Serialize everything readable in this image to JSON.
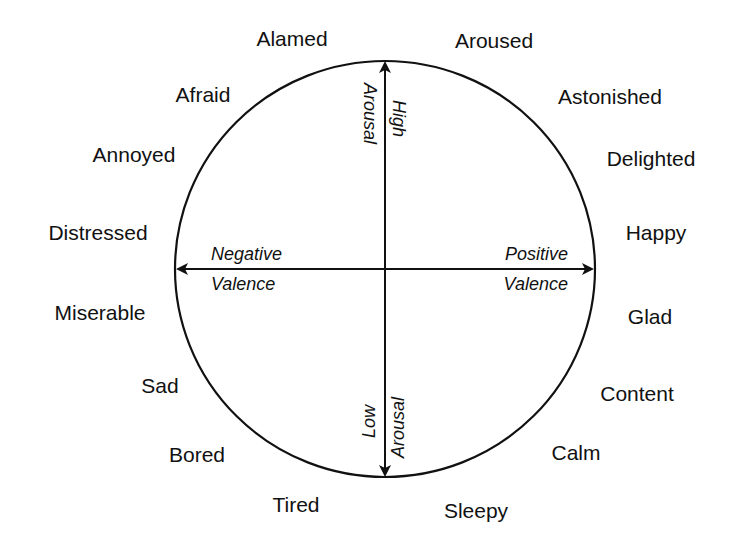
{
  "diagram": {
    "colors": {
      "stroke": "#111111",
      "background": "#ffffff"
    },
    "axes": {
      "vertical_top": {
        "line1": "High",
        "line2": "Arousal"
      },
      "vertical_bottom": {
        "line1": "Low",
        "line2": "Arousal"
      },
      "horizontal_left": {
        "line1": "Negative",
        "line2": "Valence"
      },
      "horizontal_right": {
        "line1": "Positive",
        "line2": "Valence"
      }
    },
    "emotions": [
      {
        "label": "Alamed",
        "x": 292,
        "y": 46,
        "anchor": "middle"
      },
      {
        "label": "Aroused",
        "x": 494,
        "y": 48,
        "anchor": "middle"
      },
      {
        "label": "Afraid",
        "x": 203,
        "y": 102,
        "anchor": "middle"
      },
      {
        "label": "Astonished",
        "x": 610,
        "y": 104,
        "anchor": "middle"
      },
      {
        "label": "Annoyed",
        "x": 134,
        "y": 162,
        "anchor": "middle"
      },
      {
        "label": "Delighted",
        "x": 651,
        "y": 166,
        "anchor": "middle"
      },
      {
        "label": "Distressed",
        "x": 98,
        "y": 240,
        "anchor": "middle"
      },
      {
        "label": "Happy",
        "x": 656,
        "y": 240,
        "anchor": "middle"
      },
      {
        "label": "Miserable",
        "x": 100,
        "y": 320,
        "anchor": "middle"
      },
      {
        "label": "Glad",
        "x": 650,
        "y": 324,
        "anchor": "middle"
      },
      {
        "label": "Sad",
        "x": 160,
        "y": 393,
        "anchor": "middle"
      },
      {
        "label": "Content",
        "x": 637,
        "y": 401,
        "anchor": "middle"
      },
      {
        "label": "Bored",
        "x": 197,
        "y": 462,
        "anchor": "middle"
      },
      {
        "label": "Calm",
        "x": 576,
        "y": 460,
        "anchor": "middle"
      },
      {
        "label": "Tired",
        "x": 296,
        "y": 512,
        "anchor": "middle"
      },
      {
        "label": "Sleepy",
        "x": 476,
        "y": 518,
        "anchor": "middle"
      }
    ]
  }
}
